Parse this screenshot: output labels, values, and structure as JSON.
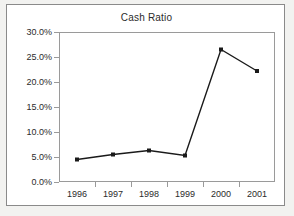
{
  "chart_data": {
    "type": "line",
    "title": "Cash Ratio",
    "xlabel": "",
    "ylabel": "",
    "categories": [
      "1996",
      "1997",
      "1998",
      "1999",
      "2000",
      "2001"
    ],
    "values": [
      4.5,
      5.5,
      6.3,
      5.3,
      26.5,
      22.2
    ],
    "value_format": "percent",
    "series": [
      {
        "name": "Cash Ratio",
        "values": [
          4.5,
          5.5,
          6.3,
          5.3,
          26.5,
          22.2
        ]
      }
    ],
    "ylim": [
      0,
      30
    ],
    "yticks": [
      0,
      5,
      10,
      15,
      20,
      25,
      30
    ],
    "ytick_labels": [
      "0.0%",
      "5.0%",
      "10.0%",
      "15.0%",
      "20.0%",
      "25.0%",
      "30.0%"
    ],
    "xtick_labels": [
      "1996",
      "1997",
      "1998",
      "1999",
      "2000",
      "2001"
    ],
    "grid": false,
    "legend": false,
    "markers": "square",
    "line_color": "#1a1a1a",
    "marker_color": "#1a1a1a",
    "plot_background": "#ffffff",
    "frame_color": "#9a9a9a",
    "text_color": "#2b2b2b",
    "page_background": "#f2f2f0"
  }
}
